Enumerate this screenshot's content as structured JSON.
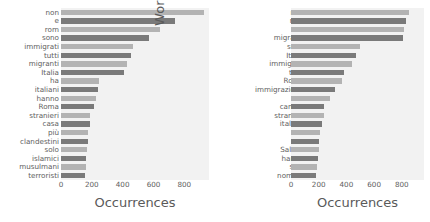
{
  "figure": {
    "background": "#ffffff",
    "plot_background": "#f2f2f2",
    "bar_color_light": "#b3b3b3",
    "bar_color_dark": "#7a7a7a"
  },
  "chart_data": [
    {
      "type": "bar",
      "orientation": "horizontal",
      "title": "",
      "xlabel": "Occurrences",
      "ylabel": "Word",
      "xlim": [
        0,
        960
      ],
      "xticks": [
        0,
        200,
        400,
        600,
        800
      ],
      "xticklabels": [
        "0",
        "200",
        "400",
        "600",
        "800"
      ],
      "grid": false,
      "legend": "none",
      "categories": [
        "non",
        "e",
        "rom",
        "sono",
        "immigrati",
        "tutti",
        "migranti",
        "Italia",
        "ha",
        "italiani",
        "hanno",
        "Roma",
        "stranieri",
        "casa",
        "più",
        "clandestini",
        "solo",
        "islamici",
        "musulmani",
        "terroristi"
      ],
      "values": [
        925,
        740,
        645,
        570,
        465,
        455,
        430,
        410,
        245,
        240,
        230,
        215,
        190,
        185,
        175,
        175,
        170,
        165,
        160,
        155
      ],
      "bar_shades": [
        "light",
        "dark",
        "light",
        "dark",
        "light",
        "dark",
        "light",
        "dark",
        "light",
        "dark",
        "light",
        "dark",
        "light",
        "dark",
        "light",
        "dark",
        "light",
        "dark",
        "light",
        "dark"
      ]
    },
    {
      "type": "bar",
      "orientation": "horizontal",
      "title": "",
      "xlabel": "Occurrences",
      "ylabel": "Word",
      "xlim": [
        0,
        960
      ],
      "xticks": [
        0,
        200,
        400,
        600,
        800
      ],
      "xticklabels": [
        "0",
        "200",
        "400",
        "600",
        "800"
      ],
      "grid": false,
      "legend": "none",
      "categories": [
        "non",
        "rom",
        "è",
        "migranti",
        "sono",
        "Italia",
        "immigrati",
        "tutti",
        "Roma",
        "immigrazione",
        "ha",
        "campo",
        "stranieri",
        "italiani",
        "più",
        "via",
        "Salvini",
        "hanno",
        "solo",
        "nomadi"
      ],
      "values": [
        855,
        830,
        815,
        805,
        500,
        470,
        440,
        385,
        365,
        315,
        280,
        240,
        235,
        225,
        210,
        205,
        200,
        195,
        185,
        180
      ],
      "bar_shades": [
        "light",
        "dark",
        "light",
        "dark",
        "light",
        "dark",
        "light",
        "dark",
        "light",
        "dark",
        "light",
        "dark",
        "light",
        "dark",
        "light",
        "dark",
        "light",
        "dark",
        "light",
        "dark"
      ]
    }
  ]
}
